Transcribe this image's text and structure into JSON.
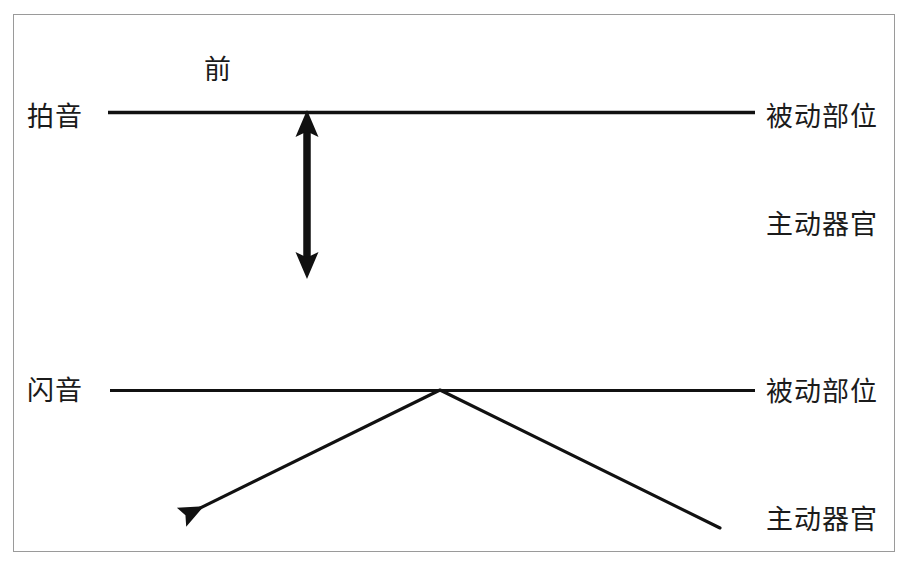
{
  "figure": {
    "title_label": "前",
    "rows": [
      {
        "name": "tap",
        "row_label": "拍音",
        "passive_label": "被动部位",
        "active_label": "主动器官",
        "motion": "vertical-double-arrow"
      },
      {
        "name": "flap",
        "row_label": "闪音",
        "passive_label": "被动部位",
        "active_label": "主动器官",
        "motion": "chevron-sweep-arrow"
      }
    ],
    "colors": {
      "stroke": "#111111",
      "frame": "#9a9a9a",
      "background": "#ffffff",
      "text": "#1b1b1b"
    }
  }
}
